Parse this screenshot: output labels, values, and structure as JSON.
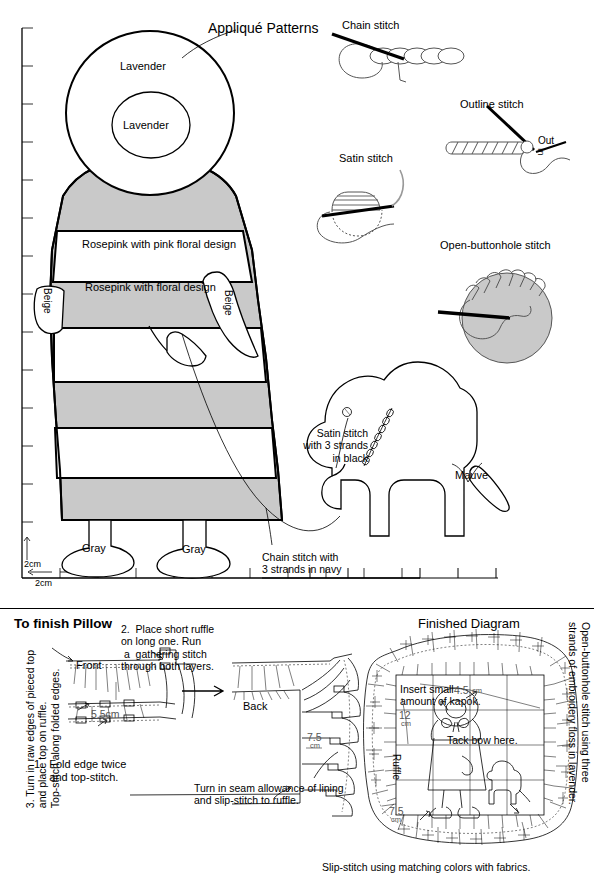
{
  "page": {
    "title": "Appliqué Patterns",
    "width": 594,
    "height": 882
  },
  "applique": {
    "title": "Appliqué Patterns",
    "grid": {
      "x_unit_label": "2cm",
      "y_unit_label": "2cm"
    },
    "fabric_labels": [
      {
        "text": "Lavender",
        "part": "bonnet-outer"
      },
      {
        "text": "Lavender",
        "part": "bonnet-inner"
      },
      {
        "text": "Rosepink with pink floral design",
        "part": "dress-upper"
      },
      {
        "text": "Rosepink with floral design",
        "part": "dress-middle"
      },
      {
        "text": "Beige",
        "part": "left-hand"
      },
      {
        "text": "Beige",
        "part": "right-arm"
      },
      {
        "text": "Gray",
        "part": "left-shoe"
      },
      {
        "text": "Gray",
        "part": "right-shoe"
      },
      {
        "text": "Mauve",
        "part": "dog-tail"
      }
    ],
    "annotations": [
      {
        "text": "Satin stitch\nwith 3 strands\nin black",
        "target": "dog-eye"
      },
      {
        "text": "Chain stitch with\n3 strands in navy",
        "target": "leash"
      }
    ]
  },
  "stitches": [
    {
      "name": "Chain stitch",
      "id": "chain-stitch"
    },
    {
      "name": "Outline stitch",
      "id": "outline-stitch",
      "marks": [
        "Out",
        "In"
      ]
    },
    {
      "name": "Satin stitch",
      "id": "satin-stitch"
    },
    {
      "name": "Open-buttonhole stitch",
      "id": "open-buttonhole-stitch"
    }
  ],
  "finish_pillow": {
    "title": "To finish Pillow",
    "step1": "1.  Fold edge twice\n     and top-stitch.",
    "step2": "2.  Place short ruffle\non long one. Run\n a  gathering stitch\nthrough both layers.",
    "step3": "3. Turn in raw edges of pieced top\nand place top on ruffle.\nTop-stitch along folded edges.",
    "front_label": "Front",
    "back_label": "Back",
    "dim_front": "5.5cm",
    "dim_back": "7.5",
    "dim_back_unit": "cm",
    "lining_note": "Turn in seam allowance of lining\nand slip-stitch to ruffle."
  },
  "finished_diagram": {
    "title": "Finished Diagram",
    "kapok_note": "Insert small\namount of kapok.",
    "tack_note": "Tack bow here.",
    "ruffle_label": "Ruffle",
    "dim_top": "4.5",
    "dim_top_unit": "cm",
    "dim_left": "12",
    "dim_left_unit": "cm",
    "dim_ruffle": "7.5",
    "dim_ruffle_unit": "cm",
    "right_note": "Open-buttonhole stitch using three\nstrands of embroidery floss in lavender.",
    "bottom_note": "Slip-stitch using matching colors with fabrics."
  },
  "colors": {
    "ink": "#000000",
    "fabric_shade": "#c9c9c9",
    "paper": "#ffffff"
  }
}
